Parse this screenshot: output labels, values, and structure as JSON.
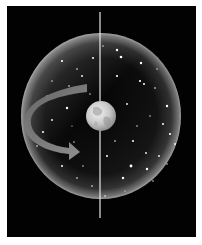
{
  "figure": {
    "colors": {
      "background": "#020202",
      "frame": "#ffffff",
      "sphere_rim": "#bdbdbd",
      "axis": "#e8e8e8",
      "arrow": "#8a8a8a",
      "earth": "#d9d9d9"
    },
    "sphere": {
      "cx": 94,
      "cy": 110,
      "rx": 80,
      "ry": 83
    },
    "earth": {
      "cx": 94,
      "cy": 110,
      "r": 15
    },
    "axis": {
      "x": 93,
      "y1": 6,
      "y2": 212
    },
    "rotation_arrow": {
      "direction": "counter-clockwise-to-right",
      "tip_x": 73,
      "tip_y": 146
    }
  }
}
